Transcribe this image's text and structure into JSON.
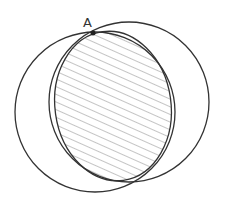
{
  "diagram": {
    "type": "geometry",
    "point_label": "A",
    "colors": {
      "stroke": "#333333",
      "hatch": "#888888",
      "background": "#ffffff"
    }
  }
}
